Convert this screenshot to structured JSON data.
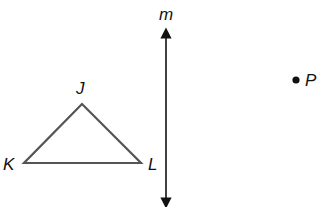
{
  "diagram": {
    "type": "geometry-reflection",
    "colors": {
      "triangle_stroke": "#555555",
      "line": "#111111",
      "point": "#111111",
      "label": "#111111"
    },
    "triangle": {
      "vertices": [
        {
          "name": "J",
          "x": 82,
          "y": 104,
          "label_x": 76,
          "label_y": 94
        },
        {
          "name": "K",
          "x": 24,
          "y": 163,
          "label_x": 3,
          "label_y": 170
        },
        {
          "name": "L",
          "x": 141,
          "y": 163,
          "label_x": 148,
          "label_y": 170
        }
      ]
    },
    "line": {
      "name": "m",
      "x": 166,
      "y1": 33,
      "y2": 203,
      "label_x": 159,
      "label_y": 20
    },
    "point": {
      "name": "P",
      "x": 296,
      "y": 80,
      "label_x": 305,
      "label_y": 86
    }
  }
}
